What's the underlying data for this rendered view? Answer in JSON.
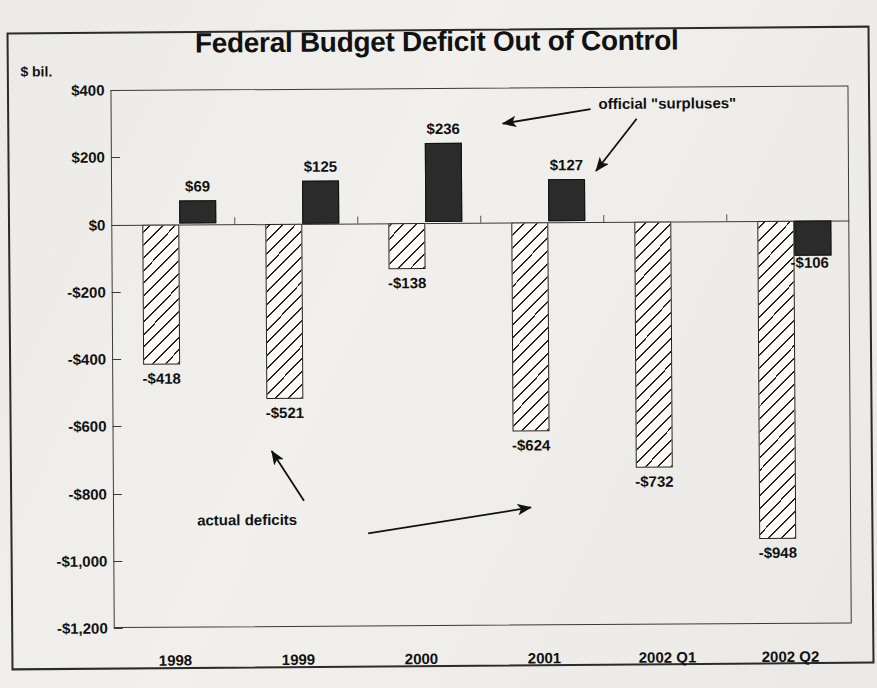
{
  "figure": {
    "title": "Federal Budget Deficit Out of Control",
    "y_unit_label": "$ bil.",
    "background_color": "#f0efeb",
    "ink_color": "#1a1a1a"
  },
  "annotations": {
    "surpluses": "official \"surpluses\"",
    "deficits": "actual deficits"
  },
  "chart_data": {
    "type": "bar",
    "title": "Federal Budget Deficit Out of Control",
    "xlabel": "",
    "ylabel": "$ bil.",
    "ylim": [
      -1200,
      400
    ],
    "ytick_step": 200,
    "yticks": [
      400,
      200,
      0,
      -200,
      -400,
      -600,
      -800,
      -1000,
      -1200
    ],
    "ytick_labels": [
      "$400",
      "$200",
      "$0",
      "-$200",
      "-$400",
      "-$600",
      "-$800",
      "-$1,000",
      "-$1,200"
    ],
    "grid": false,
    "legend": "none (arrow annotations instead)",
    "categories": [
      "1998",
      "1999",
      "2000",
      "2001",
      "2002  Q1",
      "2002  Q2"
    ],
    "series": [
      {
        "name": "actual deficits",
        "style": "diagonal-hatch",
        "values": [
          -418,
          -521,
          -138,
          -624,
          -732,
          -948
        ],
        "labels": [
          "-$418",
          "-$521",
          "-$138",
          "-$624",
          "-$732",
          "-$948"
        ]
      },
      {
        "name": "official \"surpluses\"",
        "style": "solid-black",
        "values": [
          69,
          125,
          236,
          127,
          null,
          -106
        ],
        "labels": [
          "$69",
          "$125",
          "$236",
          "$127",
          "",
          "-$106"
        ]
      }
    ]
  }
}
